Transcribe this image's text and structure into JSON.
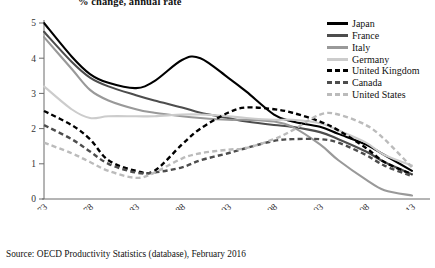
{
  "title": "% change, annual rate",
  "source": "Source: OECD Productivity Statistics (database), February 2016",
  "legend": {
    "position": "top-right",
    "items": [
      {
        "label": "Japan",
        "color": "#000000",
        "dash": false
      },
      {
        "label": "France",
        "color": "#4d4d4d",
        "dash": false
      },
      {
        "label": "Italy",
        "color": "#999999",
        "dash": false
      },
      {
        "label": "Germany",
        "color": "#cccccc",
        "dash": false
      },
      {
        "label": "United Kingdom",
        "color": "#000000",
        "dash": true
      },
      {
        "label": "Canada",
        "color": "#4d4d4d",
        "dash": true
      },
      {
        "label": "United States",
        "color": "#bbbbbb",
        "dash": true
      }
    ]
  },
  "chart_data": {
    "type": "line",
    "title": "% change, annual rate",
    "xlabel": "",
    "ylabel": "",
    "xlim": [
      1973,
      2013
    ],
    "ylim": [
      0,
      5
    ],
    "grid": false,
    "ytick_labels": [
      "0",
      "1",
      "2",
      "3",
      "4",
      "5"
    ],
    "ytick_values": [
      0,
      1,
      2,
      3,
      4,
      5
    ],
    "xtick_labels": [
      "1973",
      "1978",
      "1983",
      "1988",
      "1993",
      "1998",
      "2003",
      "2008",
      "2013"
    ],
    "xtick_values": [
      1973,
      1978,
      1983,
      1988,
      1993,
      1998,
      2003,
      2008,
      2013
    ],
    "x": [
      1973,
      1976,
      1978,
      1980,
      1983,
      1985,
      1988,
      1990,
      1993,
      1995,
      1998,
      2000,
      2003,
      2005,
      2008,
      2010,
      2013
    ],
    "series": [
      {
        "name": "Japan",
        "color": "#000000",
        "dash": false,
        "values": [
          5.0,
          4.05,
          3.55,
          3.3,
          3.15,
          3.35,
          3.95,
          4.0,
          3.45,
          3.05,
          2.4,
          2.2,
          2.05,
          1.85,
          1.55,
          1.25,
          0.8
        ]
      },
      {
        "name": "France",
        "color": "#4d4d4d",
        "dash": false,
        "values": [
          4.75,
          3.9,
          3.45,
          3.2,
          2.95,
          2.8,
          2.6,
          2.45,
          2.3,
          2.2,
          2.1,
          2.05,
          1.9,
          1.7,
          1.35,
          1.05,
          0.7
        ]
      },
      {
        "name": "Italy",
        "color": "#999999",
        "dash": false,
        "values": [
          4.6,
          3.7,
          3.1,
          2.8,
          2.55,
          2.45,
          2.35,
          2.3,
          2.25,
          2.25,
          2.2,
          2.05,
          1.55,
          1.1,
          0.55,
          0.25,
          0.1
        ]
      },
      {
        "name": "Germany",
        "color": "#cccccc",
        "dash": false,
        "values": [
          3.2,
          2.55,
          2.3,
          2.35,
          2.35,
          2.35,
          2.4,
          2.4,
          2.35,
          2.3,
          2.25,
          2.25,
          2.15,
          1.95,
          1.6,
          1.25,
          0.95
        ]
      },
      {
        "name": "United Kingdom",
        "color": "#000000",
        "dash": true,
        "values": [
          2.5,
          2.1,
          1.7,
          1.1,
          0.8,
          0.8,
          1.55,
          2.0,
          2.45,
          2.6,
          2.55,
          2.45,
          2.2,
          1.95,
          1.45,
          1.05,
          0.7
        ]
      },
      {
        "name": "Canada",
        "color": "#4d4d4d",
        "dash": true,
        "values": [
          2.1,
          1.7,
          1.35,
          1.0,
          0.75,
          0.75,
          0.9,
          1.1,
          1.3,
          1.45,
          1.65,
          1.7,
          1.7,
          1.6,
          1.25,
          0.95,
          0.65
        ]
      },
      {
        "name": "United States",
        "color": "#bbbbbb",
        "dash": true,
        "values": [
          1.6,
          1.3,
          1.05,
          0.8,
          0.6,
          0.75,
          1.15,
          1.3,
          1.4,
          1.45,
          1.7,
          1.95,
          2.4,
          2.4,
          2.1,
          1.7,
          0.9
        ]
      }
    ]
  }
}
